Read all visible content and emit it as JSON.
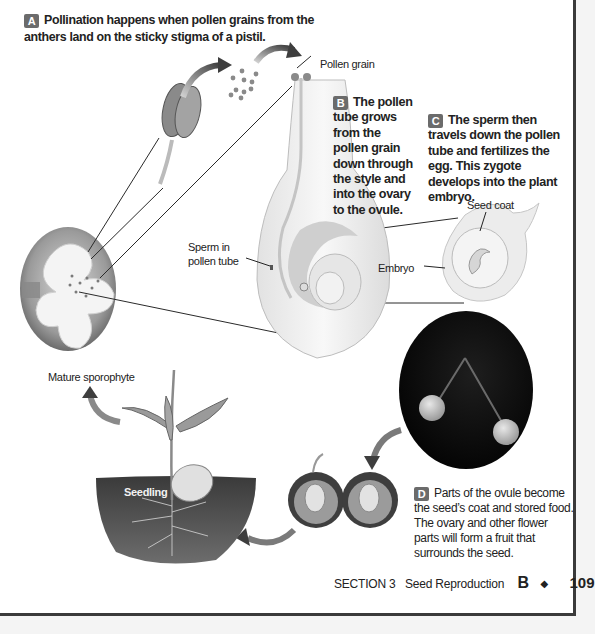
{
  "page": {
    "footer": {
      "section": "SECTION 3",
      "section_title": "Seed Reproduction",
      "unit": "B",
      "separator": "◆",
      "page_number": "109"
    }
  },
  "steps": [
    {
      "badge": "A",
      "text": "Pollination happens when pollen grains from the anthers land on the sticky stigma of a pistil."
    },
    {
      "badge": "B",
      "text": "The pollen tube grows from the pollen grain down through the style and into the ovary to the ovule."
    },
    {
      "badge": "C",
      "text": "The sperm then travels down the pollen tube and fertilizes the egg. This zygote develops into the plant embryo."
    },
    {
      "badge": "D",
      "text": "Parts of the ovule become the seed’s coat and stored food. The ovary and other flower parts will form a fruit that surrounds the seed."
    }
  ],
  "labels": {
    "pollen_grain": "Pollen grain",
    "sperm_line1": "Sperm in",
    "sperm_line2": "pollen tube",
    "seed_coat": "Seed coat",
    "embryo": "Embryo",
    "mature_sporophyte": "Mature sporophyte",
    "seedling": "Seedling"
  },
  "illustrations": [
    "flower-photo",
    "anther",
    "pollen-grains",
    "pistil-cross-section",
    "ovule-seed",
    "cherries-photo",
    "halved-cherries",
    "seedling-in-soil"
  ],
  "colors": {
    "badge_bg": "#6b6b6b",
    "page_border": "#3a3a3a",
    "text": "#222222"
  }
}
